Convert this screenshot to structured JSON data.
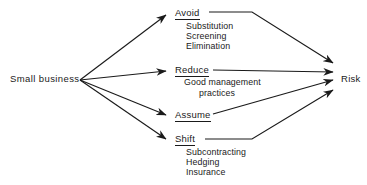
{
  "diagram": {
    "type": "risk-management-flow",
    "source": {
      "label": "Small business",
      "x": 10,
      "y": 74
    },
    "target": {
      "label": "Risk",
      "x": 341,
      "y": 74
    },
    "strategies": [
      {
        "id": "avoid",
        "label": "Avoid",
        "x": 175,
        "y": 8,
        "items": [
          {
            "label": "Substitution",
            "x": 186,
            "y": 22
          },
          {
            "label": "Screening",
            "x": 186,
            "y": 32
          },
          {
            "label": "Elimination",
            "x": 186,
            "y": 42
          }
        ]
      },
      {
        "id": "reduce",
        "label": "Reduce",
        "x": 175,
        "y": 65,
        "items": [
          {
            "label": "Good management",
            "x": 184,
            "y": 78
          },
          {
            "label": "practices",
            "x": 199,
            "y": 89
          }
        ]
      },
      {
        "id": "assume",
        "label": "Assume",
        "x": 175,
        "y": 110,
        "items": []
      },
      {
        "id": "shift",
        "label": "Shift",
        "x": 175,
        "y": 134,
        "items": [
          {
            "label": "Subcontracting",
            "x": 186,
            "y": 148
          },
          {
            "label": "Hedging",
            "x": 186,
            "y": 158
          },
          {
            "label": "Insurance",
            "x": 186,
            "y": 168
          }
        ]
      }
    ],
    "colors": {
      "line": "#1a1a1a",
      "text": "#1a1a1a",
      "background": "#ffffff"
    },
    "edges": {
      "fan_origin": {
        "x": 80,
        "y": 80
      },
      "in_arrows": [
        {
          "from": "small-business",
          "to": "avoid",
          "path": "M80,80 L166,15"
        },
        {
          "from": "small-business",
          "to": "reduce",
          "path": "M80,80 L166,71"
        },
        {
          "from": "small-business",
          "to": "assume",
          "path": "M80,80 L166,115"
        },
        {
          "from": "small-business",
          "to": "shift",
          "path": "M80,80 L166,139"
        }
      ],
      "out_arrows": [
        {
          "from": "avoid",
          "to": "risk",
          "path": "M209,13 L252,13 L331,63"
        },
        {
          "from": "reduce",
          "to": "risk",
          "path": "M212,70 L331,72"
        },
        {
          "from": "assume",
          "to": "risk",
          "path": "M212,114 L331,80"
        },
        {
          "from": "shift",
          "to": "risk",
          "path": "M205,139 L252,139 L331,90"
        }
      ]
    }
  }
}
